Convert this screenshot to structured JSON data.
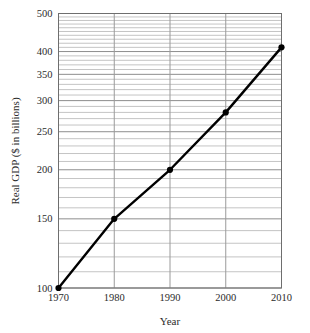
{
  "chart_data": {
    "type": "line",
    "title": "",
    "xlabel": "Year",
    "ylabel": "Real GDP ($ in billions)",
    "x": [
      1970,
      1980,
      1990,
      2000,
      2010
    ],
    "values": [
      100,
      150,
      200,
      280,
      410
    ],
    "series": [
      {
        "name": "Real GDP",
        "values": [
          100,
          150,
          200,
          280,
          410
        ]
      }
    ],
    "xlim": [
      1970,
      2010
    ],
    "ylim": [
      100,
      500
    ],
    "yscale": "log",
    "xscale": "linear",
    "grid": true,
    "grid_minor": true,
    "legend": "none",
    "marker": "filled-circle",
    "line_color": "#000000",
    "grid_color": "#aeaeae",
    "frame_color": "#6e6e6e",
    "background": "#ffffff",
    "xticks": [
      "1970",
      "1980",
      "1990",
      "2000",
      "2010"
    ],
    "yticks": [
      "100",
      "150",
      "200",
      "250",
      "300",
      "350",
      "400",
      "500"
    ],
    "ytick_values": [
      100,
      150,
      200,
      250,
      300,
      350,
      400,
      500
    ],
    "y_minor_ticks": [
      110,
      120,
      130,
      140,
      160,
      170,
      180,
      190,
      210,
      220,
      230,
      240,
      260,
      270,
      280,
      290,
      310,
      320,
      330,
      340,
      360,
      370,
      380,
      390,
      410,
      420,
      430,
      440,
      450,
      460,
      470,
      480,
      490
    ],
    "points": [
      {
        "x": 1970,
        "y": 100,
        "label": "1970"
      },
      {
        "x": 1980,
        "y": 150,
        "label": "1980"
      },
      {
        "x": 1990,
        "y": 200,
        "label": "1990"
      },
      {
        "x": 2000,
        "y": 280,
        "label": "2000"
      },
      {
        "x": 2010,
        "y": 410,
        "label": "2010"
      }
    ]
  }
}
